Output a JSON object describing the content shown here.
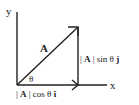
{
  "diagram": {
    "axes": {
      "y_label": "y",
      "x_label": "x"
    },
    "vector": {
      "label": "A",
      "angle_label": "θ"
    },
    "components": {
      "vertical": {
        "prefix": "| ",
        "bold": "A",
        "middle": " | sin θ ",
        "unit": "j"
      },
      "horizontal": {
        "prefix": "| ",
        "bold": "A",
        "middle": " | cos θ ",
        "unit": "î"
      }
    },
    "colors": {
      "line": "#222222",
      "background": "#ffffff"
    }
  }
}
